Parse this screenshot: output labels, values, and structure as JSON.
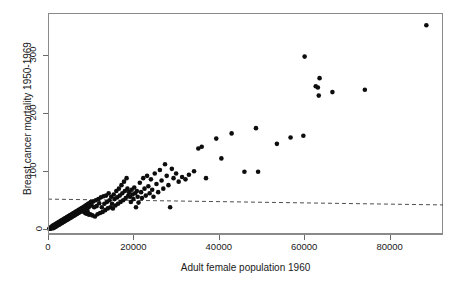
{
  "chart_data": {
    "type": "scatter",
    "title": "",
    "xlabel": "Adult female population 1960",
    "ylabel": "Breast cancer mortality 1950-1969",
    "xlim": [
      0,
      92500
    ],
    "ylim": [
      -8,
      372
    ],
    "xticks": [
      0,
      20000,
      40000,
      60000,
      80000
    ],
    "xtick_labels": [
      "0",
      "20000",
      "40000",
      "60000",
      "80000"
    ],
    "yticks": [
      0,
      100,
      200,
      300
    ],
    "ytick_labels": [
      "0",
      "100",
      "200",
      "300"
    ],
    "grid": false,
    "legend": null,
    "point_color": "#0d0d0d",
    "point_marker": "filled-circle",
    "frame_color": "#8a8a8a",
    "annotations": [
      {
        "type": "reference-line",
        "style": "dashed",
        "color": "#4d4d4d",
        "x_start": 0,
        "y_start": 52,
        "x_end": 92500,
        "y_end": 42
      }
    ],
    "series": [
      {
        "name": "counties",
        "points": [
          [
            300,
            1
          ],
          [
            420,
            2
          ],
          [
            520,
            1
          ],
          [
            610,
            3
          ],
          [
            700,
            2
          ],
          [
            780,
            4
          ],
          [
            850,
            2
          ],
          [
            920,
            5
          ],
          [
            1000,
            3
          ],
          [
            1080,
            6
          ],
          [
            1150,
            4
          ],
          [
            1220,
            2
          ],
          [
            1300,
            7
          ],
          [
            1380,
            5
          ],
          [
            1450,
            3
          ],
          [
            1520,
            8
          ],
          [
            1600,
            6
          ],
          [
            1680,
            4
          ],
          [
            1750,
            9
          ],
          [
            1820,
            7
          ],
          [
            1900,
            5
          ],
          [
            1980,
            10
          ],
          [
            2050,
            8
          ],
          [
            2120,
            6
          ],
          [
            2200,
            11
          ],
          [
            2280,
            9
          ],
          [
            2350,
            7
          ],
          [
            2420,
            12
          ],
          [
            2500,
            10
          ],
          [
            2580,
            8
          ],
          [
            2650,
            13
          ],
          [
            2720,
            11
          ],
          [
            2800,
            9
          ],
          [
            2880,
            14
          ],
          [
            2950,
            12
          ],
          [
            3020,
            10
          ],
          [
            3100,
            15
          ],
          [
            3180,
            13
          ],
          [
            3250,
            11
          ],
          [
            3320,
            16
          ],
          [
            3400,
            14
          ],
          [
            3480,
            12
          ],
          [
            3550,
            17
          ],
          [
            3620,
            15
          ],
          [
            3700,
            13
          ],
          [
            3780,
            18
          ],
          [
            3850,
            16
          ],
          [
            3920,
            14
          ],
          [
            4000,
            19
          ],
          [
            4080,
            17
          ],
          [
            4150,
            15
          ],
          [
            4220,
            20
          ],
          [
            4300,
            18
          ],
          [
            4380,
            16
          ],
          [
            4450,
            21
          ],
          [
            4520,
            19
          ],
          [
            4600,
            17
          ],
          [
            4680,
            22
          ],
          [
            4750,
            20
          ],
          [
            4820,
            18
          ],
          [
            4900,
            23
          ],
          [
            4980,
            21
          ],
          [
            5050,
            19
          ],
          [
            5120,
            24
          ],
          [
            5200,
            22
          ],
          [
            5280,
            20
          ],
          [
            5350,
            25
          ],
          [
            5420,
            23
          ],
          [
            5500,
            21
          ],
          [
            5580,
            26
          ],
          [
            5650,
            24
          ],
          [
            5720,
            22
          ],
          [
            5800,
            27
          ],
          [
            5880,
            25
          ],
          [
            5950,
            23
          ],
          [
            6020,
            28
          ],
          [
            6100,
            26
          ],
          [
            6180,
            24
          ],
          [
            6250,
            29
          ],
          [
            6320,
            27
          ],
          [
            6400,
            25
          ],
          [
            6480,
            30
          ],
          [
            6550,
            28
          ],
          [
            6620,
            26
          ],
          [
            6700,
            31
          ],
          [
            6780,
            29
          ],
          [
            6850,
            27
          ],
          [
            6920,
            32
          ],
          [
            7000,
            30
          ],
          [
            7080,
            28
          ],
          [
            7150,
            33
          ],
          [
            7220,
            31
          ],
          [
            7300,
            29
          ],
          [
            7380,
            34
          ],
          [
            7450,
            32
          ],
          [
            7520,
            30
          ],
          [
            7600,
            35
          ],
          [
            7680,
            33
          ],
          [
            7750,
            31
          ],
          [
            7820,
            36
          ],
          [
            7900,
            34
          ],
          [
            7980,
            32
          ],
          [
            8050,
            37
          ],
          [
            8120,
            35
          ],
          [
            8200,
            33
          ],
          [
            8280,
            38
          ],
          [
            8350,
            36
          ],
          [
            8420,
            30
          ],
          [
            8500,
            39
          ],
          [
            8600,
            35
          ],
          [
            8700,
            28
          ],
          [
            8800,
            41
          ],
          [
            8900,
            33
          ],
          [
            9000,
            27
          ],
          [
            9100,
            42
          ],
          [
            9200,
            36
          ],
          [
            9300,
            30
          ],
          [
            9400,
            44
          ],
          [
            9500,
            38
          ],
          [
            9600,
            25
          ],
          [
            9700,
            45
          ],
          [
            9800,
            40
          ],
          [
            9900,
            26
          ],
          [
            10000,
            47
          ],
          [
            10200,
            42
          ],
          [
            10400,
            24
          ],
          [
            10600,
            48
          ],
          [
            10800,
            38
          ],
          [
            11000,
            22
          ],
          [
            11200,
            50
          ],
          [
            11400,
            40
          ],
          [
            11600,
            26
          ],
          [
            11800,
            52
          ],
          [
            12000,
            45
          ],
          [
            12200,
            28
          ],
          [
            12400,
            55
          ],
          [
            12600,
            38
          ],
          [
            12800,
            30
          ],
          [
            13000,
            57
          ],
          [
            13200,
            44
          ],
          [
            13400,
            33
          ],
          [
            13600,
            58
          ],
          [
            13800,
            47
          ],
          [
            14000,
            36
          ],
          [
            14200,
            62
          ],
          [
            14400,
            50
          ],
          [
            14600,
            38
          ],
          [
            14800,
            56
          ],
          [
            15000,
            44
          ],
          [
            15200,
            36
          ],
          [
            15400,
            60
          ],
          [
            15600,
            52
          ],
          [
            15800,
            41
          ],
          [
            16000,
            66
          ],
          [
            16200,
            55
          ],
          [
            16400,
            44
          ],
          [
            16600,
            70
          ],
          [
            16800,
            58
          ],
          [
            17000,
            47
          ],
          [
            17200,
            76
          ],
          [
            17400,
            62
          ],
          [
            17600,
            50
          ],
          [
            17800,
            82
          ],
          [
            18000,
            66
          ],
          [
            18200,
            54
          ],
          [
            18400,
            88
          ],
          [
            18600,
            70
          ],
          [
            18800,
            58
          ],
          [
            19000,
            64
          ],
          [
            19200,
            56
          ],
          [
            19400,
            47
          ],
          [
            19600,
            68
          ],
          [
            19800,
            60
          ],
          [
            20000,
            52
          ],
          [
            20200,
            72
          ],
          [
            20400,
            62
          ],
          [
            20600,
            38
          ],
          [
            20800,
            66
          ],
          [
            21000,
            56
          ],
          [
            21200,
            46
          ],
          [
            21500,
            80
          ],
          [
            21800,
            64
          ],
          [
            22000,
            54
          ],
          [
            22300,
            88
          ],
          [
            22600,
            70
          ],
          [
            22900,
            58
          ],
          [
            23200,
            92
          ],
          [
            23500,
            74
          ],
          [
            23800,
            62
          ],
          [
            24100,
            86
          ],
          [
            24400,
            68
          ],
          [
            24700,
            56
          ],
          [
            25000,
            96
          ],
          [
            25400,
            78
          ],
          [
            25800,
            64
          ],
          [
            26200,
            102
          ],
          [
            26600,
            84
          ],
          [
            27000,
            70
          ],
          [
            27400,
            112
          ],
          [
            27800,
            92
          ],
          [
            28200,
            76
          ],
          [
            28600,
            38
          ],
          [
            29000,
            104
          ],
          [
            29400,
            88
          ],
          [
            30000,
            96
          ],
          [
            30600,
            82
          ],
          [
            31400,
            90
          ],
          [
            32200,
            86
          ],
          [
            33000,
            94
          ],
          [
            34200,
            100
          ],
          [
            35200,
            139
          ],
          [
            36000,
            142
          ],
          [
            37000,
            88
          ],
          [
            39400,
            156
          ],
          [
            40600,
            122
          ],
          [
            43000,
            165
          ],
          [
            46000,
            99
          ],
          [
            48700,
            174
          ],
          [
            49200,
            99
          ],
          [
            53600,
            147
          ],
          [
            56800,
            158
          ],
          [
            59800,
            161
          ],
          [
            60100,
            297
          ],
          [
            62700,
            246
          ],
          [
            63200,
            244
          ],
          [
            63400,
            230
          ],
          [
            63600,
            260
          ],
          [
            66600,
            236
          ],
          [
            74200,
            240
          ],
          [
            88600,
            351
          ]
        ]
      }
    ]
  }
}
